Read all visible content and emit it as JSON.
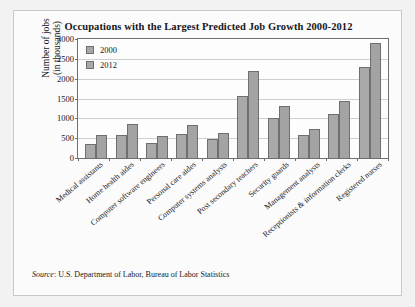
{
  "chart_data": {
    "type": "bar",
    "title": "Occupations with the Largest Predicted Job Growth 2000-2012",
    "xlabel": "",
    "ylabel": "Number of jobs (in thousands)",
    "ylabel_line1": "Number of jobs",
    "ylabel_line2": "(in thousands)",
    "ylim": [
      0,
      3000
    ],
    "yticks": [
      0,
      500,
      1000,
      1500,
      2000,
      2500,
      3000
    ],
    "ytick_labels": [
      "0",
      "500",
      "1000",
      "1500",
      "2000",
      "2500",
      "3000"
    ],
    "grid": true,
    "legend_position": "top-left",
    "categories": [
      "Medical assistants",
      "Home health aides",
      "Computer software engineers",
      "Personal care aides",
      "Computer systems analysts",
      "Post secondary teachers",
      "Security guards",
      "Management analysts",
      "Receptionists & information clerks",
      "Registered nurses"
    ],
    "series": [
      {
        "name": "2000",
        "color": "#a9a9a9",
        "values": [
          350,
          570,
          380,
          600,
          470,
          1570,
          1000,
          570,
          1100,
          2290
        ]
      },
      {
        "name": "2012",
        "color": "#a3a3a3",
        "values": [
          570,
          850,
          560,
          840,
          640,
          2190,
          1310,
          740,
          1430,
          2910
        ]
      }
    ]
  },
  "source": {
    "label": "Source",
    "text": ": U.S. Department of Labor, Bureau of Labor Statistics"
  }
}
